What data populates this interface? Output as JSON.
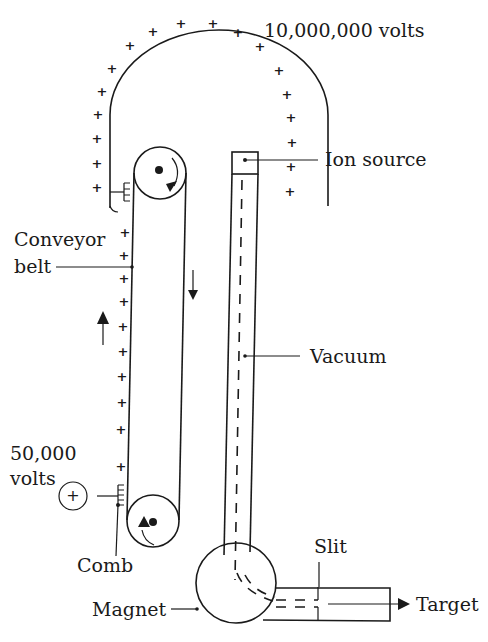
{
  "diagram": {
    "labels": {
      "terminal_voltage": "10,000,000 volts",
      "ion_source": "Ion source",
      "conveyor_belt_line1": "Conveyor",
      "conveyor_belt_line2": "belt",
      "vacuum": "Vacuum",
      "supply_voltage_line1": "50,000",
      "supply_voltage_line2": "volts",
      "comb": "Comb",
      "slit": "Slit",
      "magnet": "Magnet",
      "target": "Target"
    },
    "symbols": {
      "charge": "+",
      "supply_source": "+"
    },
    "colors": {
      "ink": "#1a1a1a",
      "background": "#ffffff"
    }
  }
}
